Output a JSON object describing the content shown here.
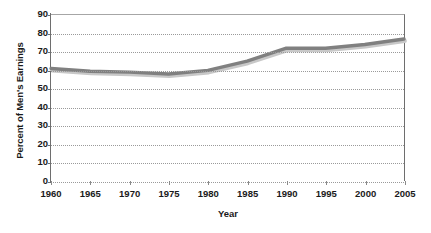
{
  "chart_data": {
    "type": "line",
    "title": "",
    "xlabel": "Year",
    "ylabel": "Percent of Men's Earnings",
    "x": [
      1960,
      1965,
      1970,
      1975,
      1980,
      1985,
      1990,
      1995,
      2000,
      2005
    ],
    "values": [
      61,
      59.5,
      59,
      58,
      60,
      65,
      72,
      72,
      74,
      77
    ],
    "series": [
      {
        "name": "Percent of Men's Earnings",
        "values": [
          61,
          59.5,
          59,
          58,
          60,
          65,
          72,
          72,
          74,
          77
        ]
      }
    ],
    "xlim": [
      1960,
      2005
    ],
    "ylim": [
      0,
      90
    ],
    "x_ticks": [
      "1960",
      "1965",
      "1970",
      "1975",
      "1980",
      "1985",
      "1990",
      "1995",
      "2000",
      "2005"
    ],
    "y_ticks": [
      "0",
      "10",
      "20",
      "30",
      "40",
      "50",
      "60",
      "70",
      "80",
      "90"
    ],
    "grid": "horizontal-dotted",
    "legend": "none",
    "line_color": "#808080",
    "shadow_color": "#c8c8c8",
    "axis_color": "#6e6e6e",
    "grid_color": "#9a9a9a",
    "background_color": "#ffffff",
    "text_color": "#1a1a1a"
  }
}
